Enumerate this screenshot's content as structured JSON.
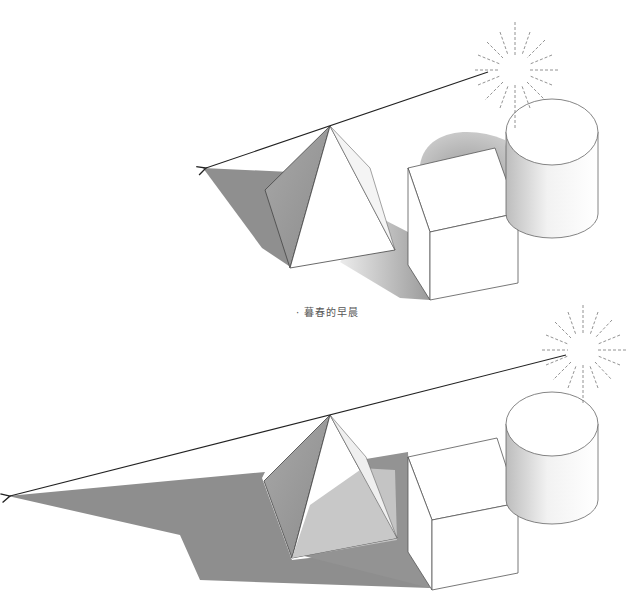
{
  "figure": {
    "caption": "· 暮春的早晨",
    "panels": [
      {
        "id": "top",
        "scene": "higher sun — shorter shadows",
        "objects": [
          "sun",
          "pyramid",
          "cube",
          "cylinder",
          "light-ray-arrow",
          "cast-shadow"
        ]
      },
      {
        "id": "bottom",
        "scene": "lower sun — longer shadows",
        "objects": [
          "sun",
          "pyramid",
          "cube",
          "cylinder",
          "light-ray-arrow",
          "cast-shadow"
        ]
      }
    ],
    "colors": {
      "shadow": "#8e8e8e",
      "shadow_light": "#bdbdbd",
      "outline": "#333333",
      "background": "#ffffff"
    }
  }
}
